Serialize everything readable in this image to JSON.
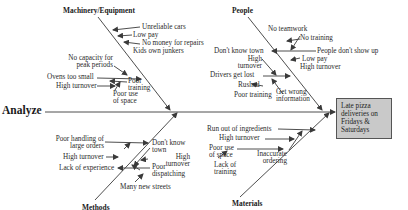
{
  "title": "Analyze",
  "effect": "Late pizza\ndeliveries on\nFridays &\nSaturdays",
  "categories": {
    "machinery": {
      "label": "Machinery/Equipment",
      "causes": [
        "Unreliable cars",
        "Low pay",
        "No money for repairs",
        "Kids own junkers",
        "No capacity for\npeak periods",
        "Ovens too small",
        "Poor\ntraining",
        "High turnover",
        "Poor use\nof space"
      ]
    },
    "people": {
      "label": "People",
      "causes": [
        "No teamwork",
        "No training",
        "People don't show up",
        "Low pay",
        "High turnover",
        "Don't know town",
        "High\nturnover",
        "Drivers get lost",
        "Rushed",
        "Poor training",
        "Get wrong\ninformation"
      ]
    },
    "methods": {
      "label": "Methods",
      "causes": [
        "Poor handling of\nlarge orders",
        "High turnover",
        "Lack of experience",
        "Don't know\ntown",
        "High\nturnover",
        "Poor\ndispatching",
        "Many new streets"
      ]
    },
    "materials": {
      "label": "Materials",
      "causes": [
        "Run out of ingredients",
        "High turnover",
        "Poor use\nof space",
        "Lack of\ntraining",
        "Inaccurate\nordering"
      ]
    }
  },
  "colors": {
    "line": "#3a3a3a",
    "effect_box": "#c9c9c9",
    "background": "#ffffff"
  }
}
